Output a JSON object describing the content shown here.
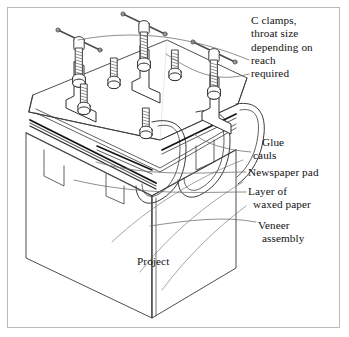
{
  "figure": {
    "background": "#ffffff",
    "border_color": "#b9b9b9",
    "line_color": "#3a3a3a",
    "text_color": "#111111"
  },
  "callouts": {
    "clamps": {
      "line1": "C clamps,",
      "line2": "throat size",
      "line3": "depending on",
      "line4": "reach",
      "line5": "required"
    },
    "glue_cauls": {
      "line1": "Glue",
      "line2": "cauls"
    },
    "newspaper_pad": {
      "line1": "Newspaper pad"
    },
    "waxed_paper": {
      "line1": "Layer of",
      "line2": "waxed paper"
    },
    "veneer_assembly": {
      "line1": "Veneer",
      "line2": "assembly"
    },
    "project": {
      "line1": "Project"
    }
  },
  "parts": [
    {
      "name": "c-clamp",
      "count": 3
    },
    {
      "name": "glue-caul",
      "count": 3
    },
    {
      "name": "newspaper-pad",
      "count": 1
    },
    {
      "name": "waxed-paper-layer",
      "count": 1
    },
    {
      "name": "veneer-assembly",
      "count": 1
    },
    {
      "name": "project-carcase",
      "count": 1
    }
  ]
}
